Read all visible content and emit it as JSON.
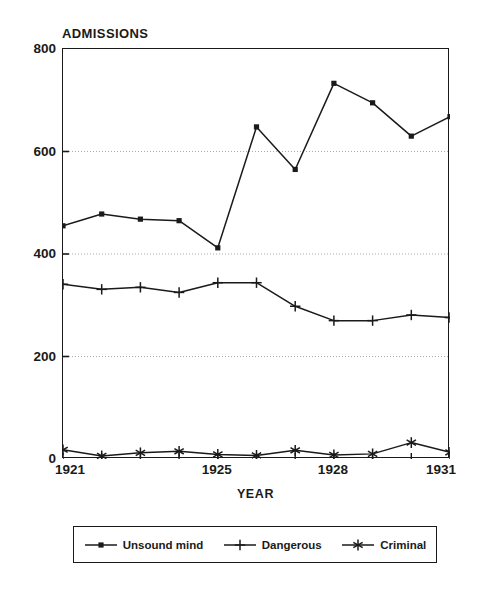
{
  "chart_data": {
    "type": "line",
    "title": "ADMISSIONS",
    "xlabel": "YEAR",
    "ylabel": "ADMISSIONS",
    "x": [
      1921,
      1922,
      1923,
      1924,
      1925,
      1926,
      1927,
      1928,
      1929,
      1930,
      1931
    ],
    "xlim": [
      1921,
      1931
    ],
    "ylim": [
      0,
      800
    ],
    "grid": "horizontal-dotted",
    "legend_position": "below-axes",
    "y_ticks": [
      0,
      200,
      400,
      600,
      800
    ],
    "y_tick_labels": [
      "0",
      "200",
      "400",
      "600",
      "800"
    ],
    "x_ticks": [
      1921,
      1922,
      1923,
      1924,
      1925,
      1926,
      1927,
      1928,
      1929,
      1930,
      1931
    ],
    "x_tick_labels_shown": [
      "1921",
      "1925",
      "1928",
      "1931"
    ],
    "x_tick_label_values": [
      1921,
      1925,
      1928,
      1931
    ],
    "gridlines_at": [
      200,
      400,
      600
    ],
    "series": [
      {
        "name": "Unsound mind",
        "marker": "filled-square",
        "values": [
          455,
          478,
          468,
          465,
          412,
          648,
          565,
          733,
          695,
          630,
          668
        ]
      },
      {
        "name": "Dangerous",
        "marker": "plus",
        "values": [
          341,
          331,
          335,
          325,
          344,
          344,
          298,
          270,
          270,
          281,
          276
        ]
      },
      {
        "name": "Criminal",
        "marker": "asterisk",
        "values": [
          18,
          6,
          12,
          15,
          9,
          7,
          17,
          8,
          10,
          32,
          13
        ]
      }
    ]
  },
  "legend": {
    "entries": [
      {
        "label": "Unsound mind",
        "marker": "filled-square"
      },
      {
        "label": "Dangerous",
        "marker": "plus"
      },
      {
        "label": "Criminal",
        "marker": "asterisk"
      }
    ]
  },
  "colors": {
    "ink": "#1a1a1a",
    "background": "#ffffff",
    "gridline": "#aaaaaa"
  }
}
